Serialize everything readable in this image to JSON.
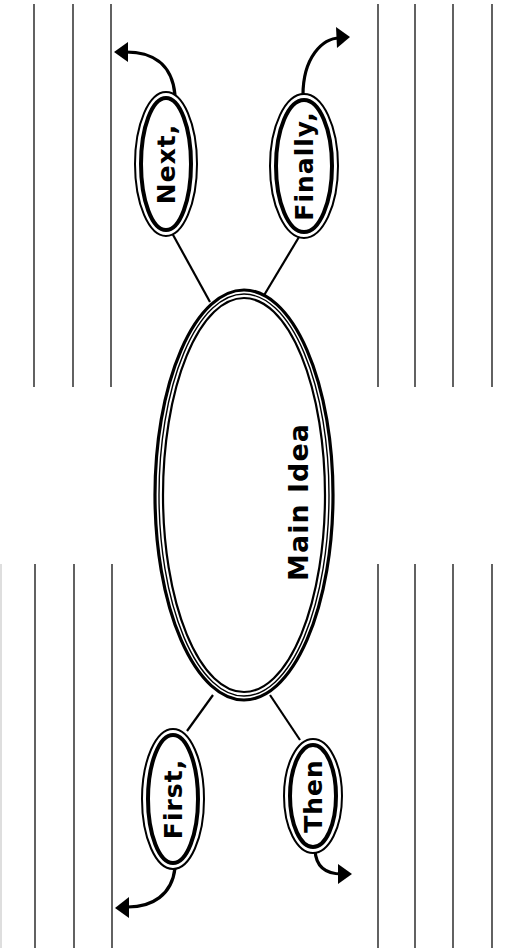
{
  "diagram": {
    "type": "main-idea graphic organizer (rotated 90°)",
    "main_idea": {
      "label": "Main Idea"
    },
    "bubbles": [
      {
        "id": "first",
        "label": "First,",
        "position": "bottom-left"
      },
      {
        "id": "next",
        "label": "Next,",
        "position": "top-left"
      },
      {
        "id": "then",
        "label": "Then",
        "position": "bottom-right"
      },
      {
        "id": "finally",
        "label": "Finally,",
        "position": "top-right"
      }
    ],
    "writing_lines": {
      "left_top_count": 3,
      "left_bottom_count": 3,
      "right_top_count": 4,
      "right_bottom_count": 4
    },
    "colors": {
      "ink": "#000000",
      "line": "#3a3a3a",
      "background": "#ffffff"
    }
  }
}
